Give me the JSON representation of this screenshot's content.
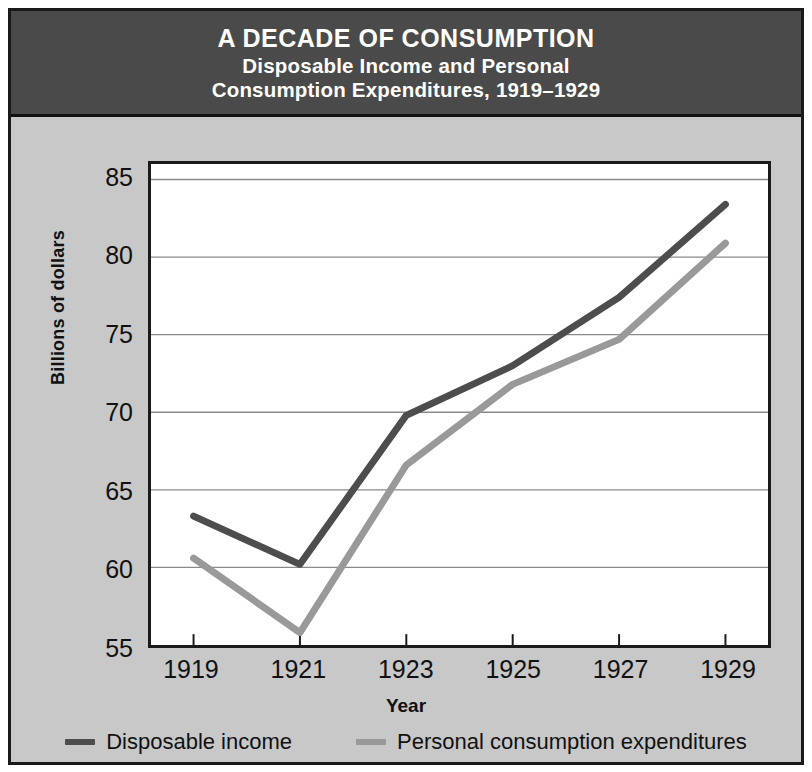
{
  "title": {
    "main": "A DECADE OF CONSUMPTION",
    "sub_line1": "Disposable Income and Personal",
    "sub_line2": "Consumption Expenditures, 1919–1929"
  },
  "colors": {
    "title_band": "#4a4a4a",
    "title_text": "#ffffff",
    "figure_background": "#c8c8c8",
    "plot_background": "#ffffff",
    "frame": "#1a1a1a",
    "gridline": "#8a8a8a",
    "series_disposable_income": "#4d4d4d",
    "series_personal_consumption": "#999999"
  },
  "chart_data": {
    "type": "line",
    "title": "A DECADE OF CONSUMPTION",
    "subtitle": "Disposable Income and Personal Consumption Expenditures, 1919–1929",
    "xlabel": "Year",
    "ylabel": "Billions of dollars",
    "x": [
      1919,
      1921,
      1923,
      1925,
      1927,
      1929
    ],
    "xtick_labels": [
      "1919",
      "1921",
      "1923",
      "1925",
      "1927",
      "1929"
    ],
    "ytick_labels": [
      "55",
      "60",
      "65",
      "70",
      "75",
      "80",
      "85"
    ],
    "yticks": [
      55,
      60,
      65,
      70,
      75,
      80,
      85
    ],
    "ylim": [
      55,
      86
    ],
    "xlim": [
      1918.2,
      1929.8
    ],
    "grid": true,
    "grid_axis": "y",
    "legend_position": "below",
    "series": [
      {
        "name": "Disposable income",
        "color": "#4d4d4d",
        "values": [
          63.3,
          60.2,
          69.8,
          73.0,
          77.4,
          83.4
        ]
      },
      {
        "name": "Personal consumption expenditures",
        "color": "#999999",
        "values": [
          60.6,
          55.8,
          66.6,
          71.8,
          74.7,
          80.9
        ]
      }
    ]
  }
}
